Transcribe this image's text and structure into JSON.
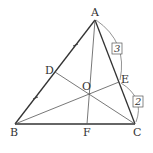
{
  "diagram": {
    "type": "triangle-cevians",
    "points": {
      "A": {
        "label": "A",
        "x": 95,
        "y": 20
      },
      "B": {
        "label": "B",
        "x": 15,
        "y": 124
      },
      "C": {
        "label": "C",
        "x": 135,
        "y": 124
      },
      "D": {
        "label": "D",
        "x": 55,
        "y": 72
      },
      "E": {
        "label": "E",
        "x": 119,
        "y": 82
      },
      "F": {
        "label": "F",
        "x": 87,
        "y": 124
      },
      "O": {
        "label": "O",
        "x": 90,
        "y": 94
      }
    },
    "ratios": {
      "AE": "3",
      "EC": "2"
    },
    "equal_marks": [
      "AD",
      "DB"
    ],
    "colors": {
      "stroke": "#333333",
      "thin_stroke": "#555555",
      "background": "#ffffff"
    }
  }
}
